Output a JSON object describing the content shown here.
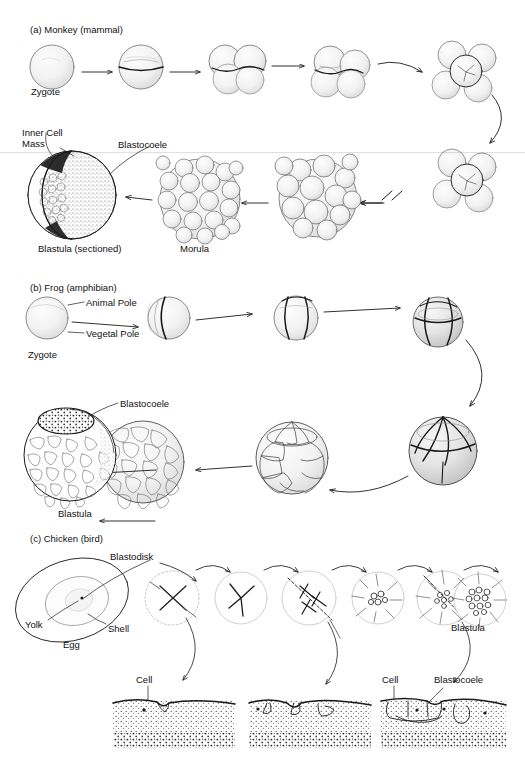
{
  "figure": {
    "title_visible": false,
    "background": "#ffffff",
    "ink": "#1a1a1a",
    "shade": "#d9d9d9"
  },
  "sections": [
    {
      "id": "monkey",
      "heading": "(a) Monkey (mammal)",
      "heading_pos": {
        "x": 30,
        "y": 30
      },
      "labels": [
        {
          "name": "zygote-label",
          "text": "Zygote",
          "x": 31,
          "y": 86
        },
        {
          "name": "inner-cell-mass-label",
          "text": "Inner Cell\nMass",
          "x": 22,
          "y": 127
        },
        {
          "name": "blastocoele-label",
          "text": "Blastocoele",
          "x": 118,
          "y": 139
        },
        {
          "name": "blastula-sectioned-label",
          "text": "Blastula (sectioned)",
          "x": 40,
          "y": 245
        },
        {
          "name": "morula-label",
          "text": "Morula",
          "x": 222,
          "y": 245
        }
      ],
      "stages": [
        {
          "name": "zygote",
          "cells": 1
        },
        {
          "name": "two-cell",
          "cells": 2
        },
        {
          "name": "four-cell",
          "cells": 4
        },
        {
          "name": "eight-cell",
          "cells": 8
        },
        {
          "name": "sixteen-cell",
          "cells": 16
        },
        {
          "name": "cell-cluster",
          "cells": 32
        },
        {
          "name": "early-morula",
          "cells": 48
        },
        {
          "name": "morula",
          "cells": 64
        },
        {
          "name": "blastula-sectioned",
          "cells": 0
        }
      ]
    },
    {
      "id": "frog",
      "heading": "(b) Frog (amphibian)",
      "heading_pos": {
        "x": 30,
        "y": 287
      },
      "labels": [
        {
          "name": "animal-pole-label",
          "text": "Animal Pole",
          "x": 72,
          "y": 303
        },
        {
          "name": "vegetal-pole-label",
          "text": "Vegetal Pole",
          "x": 72,
          "y": 330
        },
        {
          "name": "zygote-label",
          "text": "Zygote",
          "x": 28,
          "y": 348
        },
        {
          "name": "blastocoele-label",
          "text": "Blastocoele",
          "x": 120,
          "y": 399
        },
        {
          "name": "blastula-label",
          "text": "Blastula",
          "x": 58,
          "y": 510
        }
      ],
      "stages": [
        {
          "name": "zygote",
          "cells": 1
        },
        {
          "name": "two-cell",
          "cells": 2
        },
        {
          "name": "four-cell",
          "cells": 4
        },
        {
          "name": "eight-cell",
          "cells": 8
        },
        {
          "name": "sixteen-cell",
          "cells": 16
        },
        {
          "name": "morula",
          "cells": 32
        },
        {
          "name": "late-morula",
          "cells": 64
        },
        {
          "name": "blastula",
          "cells": 0
        }
      ]
    },
    {
      "id": "chicken",
      "heading": "(c) Chicken (bird)",
      "heading_pos": {
        "x": 30,
        "y": 538
      },
      "labels": [
        {
          "name": "blastodisk-label",
          "text": "Blastodisk",
          "x": 108,
          "y": 556
        },
        {
          "name": "yolk-label",
          "text": "Yolk",
          "x": 26,
          "y": 624
        },
        {
          "name": "shell-label",
          "text": "Shell",
          "x": 108,
          "y": 628
        },
        {
          "name": "egg-label",
          "text": "Egg",
          "x": 63,
          "y": 643
        },
        {
          "name": "blastula-label",
          "text": "Blastula",
          "x": 452,
          "y": 625
        },
        {
          "name": "cell-label-left",
          "text": "Cell",
          "x": 139,
          "y": 679
        },
        {
          "name": "cell-label-right",
          "text": "Cell",
          "x": 385,
          "y": 679
        },
        {
          "name": "blastocoele-label",
          "text": "Blastocoele",
          "x": 437,
          "y": 679
        }
      ],
      "stages": [
        {
          "name": "egg-whole",
          "cells": 0
        },
        {
          "name": "blastodisk-2cell",
          "cells": 2
        },
        {
          "name": "blastodisk-3cell",
          "cells": 3
        },
        {
          "name": "blastodisk-multi",
          "cells": 8
        },
        {
          "name": "blastodisk-cluster",
          "cells": 16
        },
        {
          "name": "blastodisk-dense",
          "cells": 32
        },
        {
          "name": "blastula",
          "cells": 64
        }
      ],
      "cross_sections": [
        {
          "name": "cross-section-early"
        },
        {
          "name": "cross-section-mid"
        },
        {
          "name": "cross-section-late"
        }
      ]
    }
  ],
  "artifacts": {
    "scanline_y": 152
  }
}
